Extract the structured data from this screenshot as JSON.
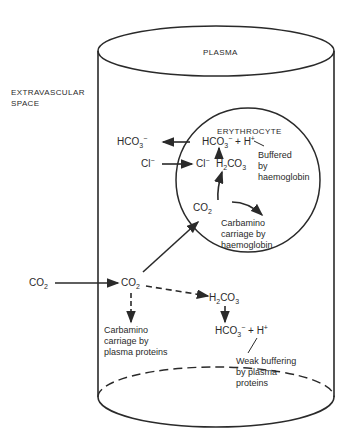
{
  "diagram": {
    "title_region_plasma": "PLASMA",
    "region_extravascular": [
      "EXTRAVASCULAR",
      "SPACE"
    ],
    "region_erythrocyte": "ERYTHROCYTE",
    "external": {
      "co2": {
        "base": "CO",
        "sub": "2"
      },
      "hco3": {
        "base": "HCO",
        "sub": "3",
        "sup": "−"
      },
      "cl": {
        "base": "Cl",
        "sup": "−"
      }
    },
    "erythrocyte": {
      "hco3_h": {
        "base": "HCO",
        "sub": "3",
        "sup": "−",
        "plus": " + H",
        "plus_sup": "+"
      },
      "cl": {
        "base": "Cl",
        "sup": "−"
      },
      "h2co3": {
        "a": "H",
        "sub1": "2",
        "b": "CO",
        "sub2": "3"
      },
      "co2": {
        "base": "CO",
        "sub": "2"
      },
      "note_buffered": [
        "Buffered",
        "by",
        "haemoglobin"
      ],
      "note_carbamino": [
        "Carbamino",
        "carriage by",
        "haemoglobin"
      ]
    },
    "plasma": {
      "co2": {
        "base": "CO",
        "sub": "2"
      },
      "h2co3": {
        "a": "H",
        "sub1": "2",
        "b": "CO",
        "sub2": "3"
      },
      "hco3_h": {
        "base": "HCO",
        "sub": "3",
        "sup": "−",
        "plus": " + H",
        "plus_sup": "+"
      },
      "note_carbamino": [
        "Carbamino",
        "carriage by",
        "plasma proteins"
      ],
      "note_weak": [
        "Weak buffering",
        "by plasma",
        "proteins"
      ]
    },
    "colors": {
      "ink": "#2a2a2a",
      "background": "#ffffff"
    }
  }
}
